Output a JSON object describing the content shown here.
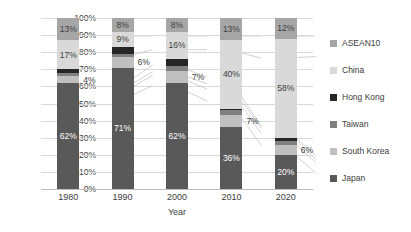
{
  "chart_data": {
    "type": "bar",
    "subtype": "100% stacked column",
    "title": "",
    "xlabel": "Year",
    "ylabel": "",
    "categories": [
      "1980",
      "1990",
      "2000",
      "2010",
      "2020"
    ],
    "ylim": [
      0,
      100
    ],
    "ytick_labels": [
      "0%",
      "10%",
      "20%",
      "30%",
      "40%",
      "50%",
      "60%",
      "70%",
      "80%",
      "90%",
      "100%"
    ],
    "ytick_values": [
      0,
      10,
      20,
      30,
      40,
      50,
      60,
      70,
      80,
      90,
      100
    ],
    "grid": true,
    "legend_position": "right",
    "connector_lines": true,
    "series": [
      {
        "name": "Japan",
        "color": "#595959",
        "values": [
          62,
          71,
          62,
          36,
          20
        ],
        "labels": [
          "62%",
          "71%",
          "62%",
          "36%",
          "20%"
        ]
      },
      {
        "name": "South Korea",
        "color": "#bfbfbf",
        "values": [
          4,
          6,
          7,
          7,
          6
        ],
        "labels": [
          "4%",
          "6%",
          "7%",
          "7%",
          "6%"
        ]
      },
      {
        "name": "Taiwan",
        "color": "#808080",
        "values": [
          2,
          2,
          3,
          3,
          2
        ],
        "labels": [
          "",
          "",
          "",
          "",
          ""
        ]
      },
      {
        "name": "Hong Kong",
        "color": "#262626",
        "values": [
          2,
          4,
          4,
          1,
          2
        ],
        "labels": [
          "",
          "",
          "",
          "",
          ""
        ]
      },
      {
        "name": "China",
        "color": "#d9d9d9",
        "values": [
          17,
          9,
          16,
          40,
          58
        ],
        "labels": [
          "17%",
          "9%",
          "16%",
          "40%",
          "58%"
        ]
      },
      {
        "name": "ASEAN10",
        "color": "#a6a6a6",
        "values": [
          13,
          8,
          8,
          13,
          12
        ],
        "labels": [
          "13%",
          "8%",
          "8%",
          "13%",
          "12%"
        ]
      }
    ]
  },
  "legend": {
    "items": [
      {
        "label": "ASEAN10",
        "color": "#a6a6a6"
      },
      {
        "label": "China",
        "color": "#d9d9d9"
      },
      {
        "label": "Hong Kong",
        "color": "#262626"
      },
      {
        "label": "Taiwan",
        "color": "#808080"
      },
      {
        "label": "South Korea",
        "color": "#bfbfbf"
      },
      {
        "label": "Japan",
        "color": "#595959"
      }
    ]
  }
}
